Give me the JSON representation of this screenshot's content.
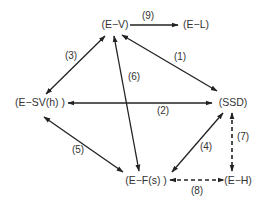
{
  "diagram": {
    "type": "relationship-graph",
    "nodes": [
      {
        "id": "EV",
        "label": "(E−V)",
        "x": 115,
        "y": 28
      },
      {
        "id": "EL",
        "label": "(E−L)",
        "x": 196,
        "y": 28
      },
      {
        "id": "ESV",
        "label": "(E−SV(h) )",
        "x": 40,
        "y": 106
      },
      {
        "id": "SSD",
        "label": "(SSD)",
        "x": 233,
        "y": 106
      },
      {
        "id": "EF",
        "label": "(E−F(s) )",
        "x": 146,
        "y": 184
      },
      {
        "id": "EH",
        "label": "(E−H)",
        "x": 238,
        "y": 184
      }
    ],
    "edges": [
      {
        "id": "1",
        "label": "(1)",
        "from": "EV",
        "to": "SSD",
        "style": "solid",
        "direction": "both",
        "x1": 122,
        "y1": 35,
        "x2": 217,
        "y2": 91,
        "lx": 180,
        "ly": 60
      },
      {
        "id": "2",
        "label": "(2)",
        "from": "ESV",
        "to": "SSD",
        "style": "solid",
        "direction": "both",
        "x1": 68,
        "y1": 103,
        "x2": 212,
        "y2": 103,
        "lx": 163,
        "ly": 114
      },
      {
        "id": "3",
        "label": "(3)",
        "from": "EV",
        "to": "ESV",
        "style": "solid",
        "direction": "both",
        "x1": 105,
        "y1": 36,
        "x2": 46,
        "y2": 94,
        "lx": 71,
        "ly": 59
      },
      {
        "id": "4",
        "label": "(4)",
        "from": "SSD",
        "to": "EF",
        "style": "solid",
        "direction": "both",
        "x1": 223,
        "y1": 113,
        "x2": 172,
        "y2": 172,
        "lx": 206,
        "ly": 150
      },
      {
        "id": "5",
        "label": "(5)",
        "from": "ESV",
        "to": "EF",
        "style": "solid",
        "direction": "both",
        "x1": 44,
        "y1": 117,
        "x2": 123,
        "y2": 172,
        "lx": 78,
        "ly": 153
      },
      {
        "id": "6",
        "label": "(6)",
        "from": "EV",
        "to": "EF",
        "style": "solid",
        "direction": "both",
        "x1": 114,
        "y1": 36,
        "x2": 139,
        "y2": 171,
        "lx": 134,
        "ly": 80
      },
      {
        "id": "7",
        "label": "(7)",
        "from": "SSD",
        "to": "EH",
        "style": "dashed",
        "direction": "both",
        "x1": 232,
        "y1": 113,
        "x2": 232,
        "y2": 171,
        "lx": 243,
        "ly": 140
      },
      {
        "id": "8",
        "label": "(8)",
        "from": "EF",
        "to": "EH",
        "style": "dashed",
        "direction": "both",
        "x1": 170,
        "y1": 180,
        "x2": 224,
        "y2": 180,
        "lx": 197,
        "ly": 194
      },
      {
        "id": "9",
        "label": "(9)",
        "from": "EV",
        "to": "EL",
        "style": "solid",
        "direction": "forward",
        "x1": 130,
        "y1": 25,
        "x2": 178,
        "y2": 25,
        "lx": 148,
        "ly": 19
      }
    ]
  }
}
